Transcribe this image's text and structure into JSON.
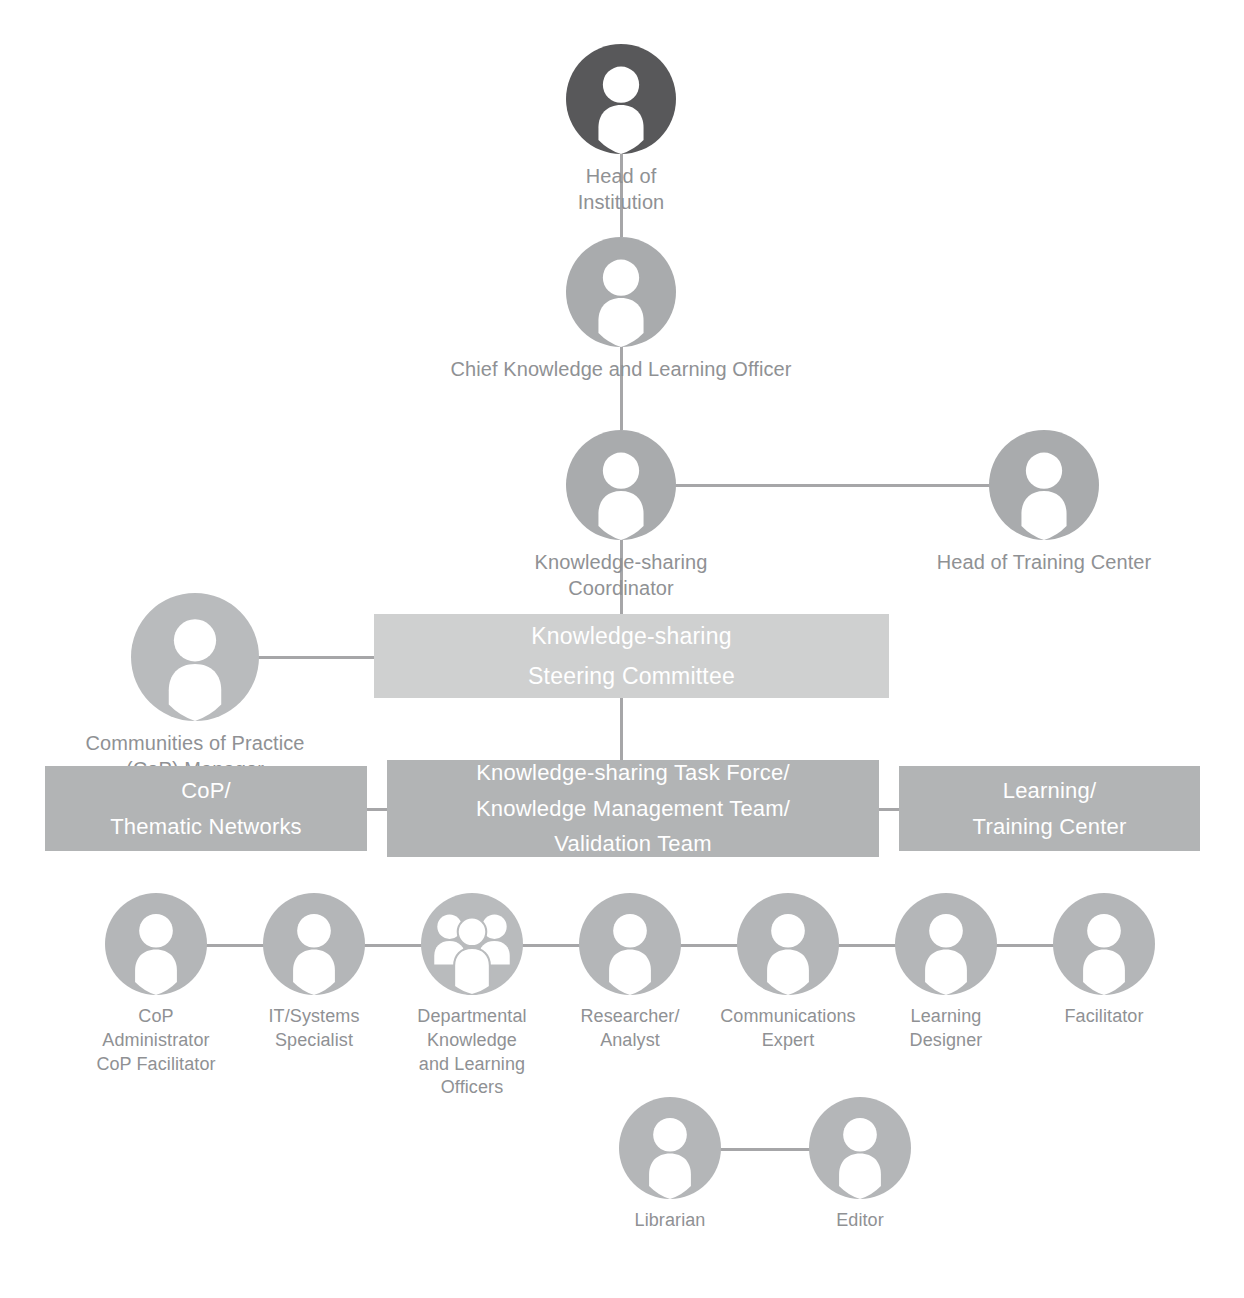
{
  "colors": {
    "head_circle": "#58585a",
    "mid_circle": "#a9abad",
    "role_circle": "#b4b6b8",
    "group_circle_outline": "#b9bbbd",
    "connector": "#a6a6a8",
    "steering_box": "#cfd0d0",
    "team_box": "#b2b4b5",
    "label_text": "#8f9194",
    "box_text": "#ffffff",
    "background": "#ffffff"
  },
  "nodes": {
    "head_of_institution": {
      "label": "Head of Institution",
      "icon": "person-icon",
      "tone": "dark"
    },
    "chief_knowledge_officer": {
      "label": "Chief Knowledge and Learning Officer",
      "icon": "person-icon",
      "tone": "mid"
    },
    "knowledge_sharing_coordinator": {
      "label": "Knowledge-sharing Coordinator",
      "icon": "person-icon",
      "tone": "mid"
    },
    "head_of_training_center": {
      "label": "Head of Training Center",
      "icon": "person-icon",
      "tone": "mid"
    },
    "cop_manager": {
      "label": "Communities of Practice\n(CoP) Manager",
      "icon": "person-icon",
      "tone": "mid"
    }
  },
  "boxes": {
    "steering_committee": {
      "label": "Knowledge-sharing\nSteering Committee"
    },
    "cop_thematic_networks": {
      "label": "CoP/\nThematic Networks"
    },
    "task_force": {
      "label": "Knowledge-sharing Task Force/\nKnowledge Management Team/\nValidation Team"
    },
    "learning_training_center": {
      "label": "Learning/\nTraining Center"
    }
  },
  "roles_row": [
    {
      "label": "CoP\nAdministrator\nCoP Facilitator",
      "icon": "person-icon"
    },
    {
      "label": "IT/Systems\nSpecialist",
      "icon": "person-icon"
    },
    {
      "label": "Departmental\nKnowledge\nand Learning\nOfficers",
      "icon": "people-group-icon"
    },
    {
      "label": "Researcher/\nAnalyst",
      "icon": "person-icon"
    },
    {
      "label": "Communications\nExpert",
      "icon": "person-icon"
    },
    {
      "label": "Learning\nDesigner",
      "icon": "person-icon"
    },
    {
      "label": "Facilitator",
      "icon": "person-icon"
    }
  ],
  "bottom_row": [
    {
      "label": "Librarian",
      "icon": "person-icon"
    },
    {
      "label": "Editor",
      "icon": "person-icon"
    }
  ]
}
